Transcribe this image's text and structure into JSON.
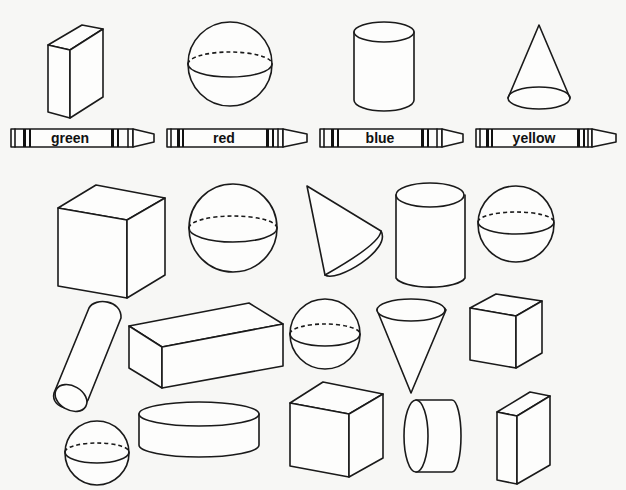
{
  "worksheet": {
    "background": "#f7f7f5",
    "ink": "#1a1a1a",
    "key": [
      {
        "shape": "rectangular-prism",
        "color_word": "green"
      },
      {
        "shape": "sphere",
        "color_word": "red"
      },
      {
        "shape": "cylinder",
        "color_word": "blue"
      },
      {
        "shape": "cone",
        "color_word": "yellow"
      }
    ],
    "shapes": [
      {
        "id": 1,
        "type": "cube"
      },
      {
        "id": 2,
        "type": "sphere"
      },
      {
        "id": 3,
        "type": "cone"
      },
      {
        "id": 4,
        "type": "cylinder"
      },
      {
        "id": 5,
        "type": "sphere"
      },
      {
        "id": 6,
        "type": "cylinder"
      },
      {
        "id": 7,
        "type": "rectangular-prism"
      },
      {
        "id": 8,
        "type": "sphere"
      },
      {
        "id": 9,
        "type": "cone"
      },
      {
        "id": 10,
        "type": "cube"
      },
      {
        "id": 11,
        "type": "sphere"
      },
      {
        "id": 12,
        "type": "cylinder"
      },
      {
        "id": 13,
        "type": "cube"
      },
      {
        "id": 14,
        "type": "cylinder"
      },
      {
        "id": 15,
        "type": "rectangular-prism"
      }
    ]
  }
}
